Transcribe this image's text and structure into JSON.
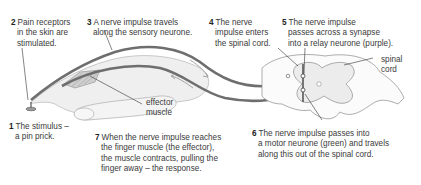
{
  "diagram": {
    "colors": {
      "background": "#ffffff",
      "text": "#3a3a3a",
      "nerve": "#6b6b6b",
      "outline": "#8a8a8a",
      "hand_fill": "#ededed",
      "spinal_fill": "#f0f0f0"
    },
    "labels": [
      {
        "id": "step-1",
        "num": "1",
        "lines": [
          "The stimulus –",
          "a pin prick."
        ]
      },
      {
        "id": "step-2",
        "num": "2",
        "lines": [
          "Pain receptors",
          "in the skin are",
          "stimulated."
        ]
      },
      {
        "id": "step-3",
        "num": "3",
        "lines": [
          "A nerve impulse travels",
          "along the sensory neurone."
        ]
      },
      {
        "id": "step-4",
        "num": "4",
        "lines": [
          "The nerve",
          "impulse enters",
          "the spinal cord."
        ]
      },
      {
        "id": "step-5",
        "num": "5",
        "lines": [
          "The nerve impulse",
          "passes across a synapse",
          "into a relay neurone (purple)."
        ]
      },
      {
        "id": "step-6",
        "num": "6",
        "lines": [
          "The nerve impulse passes into",
          "a motor neurone (green) and travels",
          "along this out of the spinal cord."
        ]
      },
      {
        "id": "step-7",
        "num": "7",
        "lines": [
          "When the nerve impulse reaches",
          "the finger muscle (the effector),",
          "the muscle contracts, pulling the",
          "finger away – the response."
        ]
      },
      {
        "id": "effector",
        "num": "",
        "lines": [
          "effector",
          "muscle"
        ]
      },
      {
        "id": "spinal-cord",
        "num": "",
        "lines": [
          "spinal",
          "cord"
        ]
      }
    ]
  }
}
